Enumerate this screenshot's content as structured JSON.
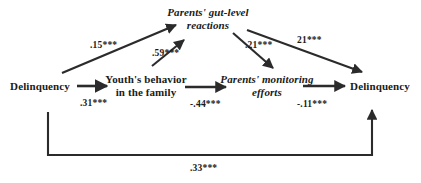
{
  "figure": {
    "type": "path-diagram",
    "nodes": [
      {
        "id": "gut_level",
        "label_line1": "Parents' gut-level",
        "label_line2": "reactions",
        "style": "italic"
      },
      {
        "id": "delinquency_t1",
        "label_line1": "Delinquency",
        "label_line2": "",
        "style": "roman"
      },
      {
        "id": "youth_behavior",
        "label_line1": "Youth's behavior",
        "label_line2": "in the family",
        "style": "roman"
      },
      {
        "id": "monitoring",
        "label_line1": "Parents' monitoring",
        "label_line2": "efforts",
        "style": "italic"
      },
      {
        "id": "delinquency_t2",
        "label_line1": "Delinquency",
        "label_line2": "",
        "style": "roman"
      }
    ],
    "paths": [
      {
        "id": "p1",
        "from": "delinquency_t1",
        "to": "gut_level",
        "coefficient": ".15***"
      },
      {
        "id": "p2",
        "from": "delinquency_t1",
        "to": "youth_behavior",
        "coefficient": ".31***"
      },
      {
        "id": "p3",
        "from": "youth_behavior",
        "to": "gut_level",
        "coefficient": ".59***"
      },
      {
        "id": "p4",
        "from": "youth_behavior",
        "to": "monitoring",
        "coefficient": "-.44***"
      },
      {
        "id": "p5",
        "from": "gut_level",
        "to": "monitoring",
        "coefficient": ".21***"
      },
      {
        "id": "p6",
        "from": "gut_level",
        "to": "delinquency_t2",
        "coefficient": "21***"
      },
      {
        "id": "p7",
        "from": "monitoring",
        "to": "delinquency_t2",
        "coefficient": "-.11***"
      },
      {
        "id": "p8",
        "from": "delinquency_t1",
        "to": "delinquency_t2",
        "coefficient": ".33***"
      }
    ],
    "colors": {
      "line": "#2b2b2b",
      "text": "#1a1a1a",
      "background": "#ffffff"
    }
  }
}
